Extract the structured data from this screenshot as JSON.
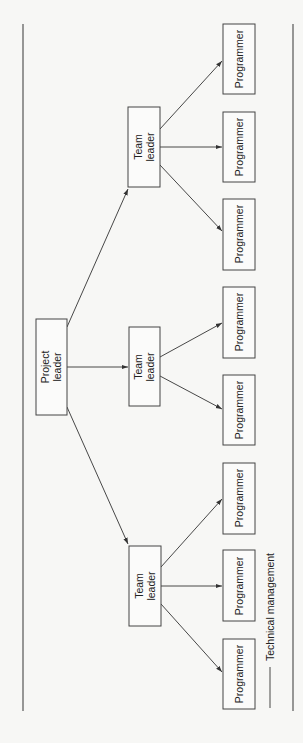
{
  "diagram": {
    "type": "org-chart",
    "orientation": "rotated-90-ccw",
    "root": {
      "id": "project-leader",
      "label_lines": [
        "Project",
        "leader"
      ]
    },
    "team_leaders": [
      {
        "id": "team-leader-1",
        "label_lines": [
          "Team",
          "leader"
        ],
        "programmers": [
          "Programmer",
          "Programmer",
          "Programmer"
        ]
      },
      {
        "id": "team-leader-2",
        "label_lines": [
          "Team",
          "leader"
        ],
        "programmers": [
          "Programmer",
          "Programmer"
        ]
      },
      {
        "id": "team-leader-3",
        "label_lines": [
          "Team",
          "leader"
        ],
        "programmers": [
          "Programmer",
          "Programmer",
          "Programmer"
        ]
      }
    ],
    "edges": [
      [
        "project-leader",
        "team-leader-1"
      ],
      [
        "project-leader",
        "team-leader-2"
      ],
      [
        "project-leader",
        "team-leader-3"
      ],
      [
        "team-leader-1",
        "programmer-1"
      ],
      [
        "team-leader-1",
        "programmer-2"
      ],
      [
        "team-leader-1",
        "programmer-3"
      ],
      [
        "team-leader-2",
        "programmer-4"
      ],
      [
        "team-leader-2",
        "programmer-5"
      ],
      [
        "team-leader-3",
        "programmer-6"
      ],
      [
        "team-leader-3",
        "programmer-7"
      ],
      [
        "team-leader-3",
        "programmer-8"
      ]
    ],
    "legend": {
      "line_style": "solid",
      "label": "Technical management"
    }
  },
  "labels": {
    "project_1": "Project",
    "project_2": "leader",
    "team_1": "Team",
    "team_2": "leader",
    "programmer": "Programmer",
    "legend": "Technical management"
  },
  "colors": {
    "line": "#333333",
    "background": "#f7f7f5"
  }
}
